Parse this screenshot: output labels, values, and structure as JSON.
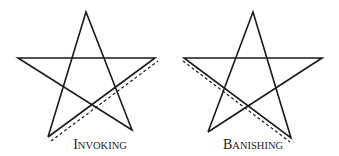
{
  "figure": {
    "stroke_color": "#1a1a1a",
    "background": "#ffffff",
    "pentagrams": [
      {
        "name": "invoking",
        "label": "Invoking",
        "label_first": "I",
        "label_rest": "NVOKING",
        "vertices": {
          "top": [
            86,
            12
          ],
          "left": [
            18,
            58
          ],
          "right": [
            155,
            58
          ],
          "bottom_left": [
            48,
            137
          ],
          "bottom_right": [
            132,
            130
          ]
        },
        "dashed_stroke": {
          "from": [
            51,
            141
          ],
          "to": [
            158,
            61
          ],
          "direction": "bottom-left to right"
        }
      },
      {
        "name": "banishing",
        "label": "Banishing",
        "label_first": "B",
        "label_rest": "ANISHING",
        "vertices": {
          "top": [
            253,
            12
          ],
          "left": [
            184,
            58
          ],
          "right": [
            322,
            58
          ],
          "bottom_left": [
            208,
            132
          ],
          "bottom_right": [
            291,
            138
          ]
        },
        "dashed_stroke": {
          "from": [
            183,
            61
          ],
          "to": [
            290,
            142
          ],
          "direction": "left to bottom-right"
        }
      }
    ]
  }
}
